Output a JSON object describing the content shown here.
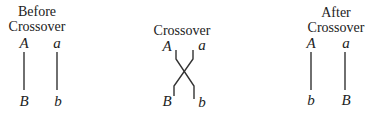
{
  "panels": [
    {
      "id": "before",
      "title_lines": [
        "Before",
        "Crossover"
      ],
      "top_alleles": [
        "A",
        "a"
      ],
      "bottom_alleles": [
        "B",
        "b"
      ]
    },
    {
      "id": "during",
      "title_lines": [
        "Crossover"
      ],
      "top_alleles": [
        "A",
        "a"
      ],
      "bottom_alleles": [
        "B",
        "b"
      ]
    },
    {
      "id": "after",
      "title_lines": [
        "After",
        "Crossover"
      ],
      "top_alleles": [
        "A",
        "a"
      ],
      "bottom_alleles": [
        "b",
        "B"
      ]
    }
  ],
  "colors": {
    "line": "#333333",
    "text": "#222222",
    "background": "#ffffff"
  }
}
